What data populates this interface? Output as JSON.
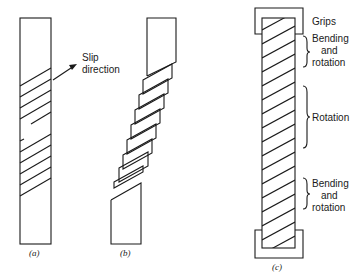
{
  "figure": {
    "panels": [
      {
        "id": "a",
        "caption": "(a)",
        "annotation": {
          "line1": "Slip",
          "line2": "direction"
        }
      },
      {
        "id": "b",
        "caption": "(b)"
      },
      {
        "id": "c",
        "caption": "(c)",
        "labels": {
          "grips": "Grips",
          "top_region": {
            "line1": "Bending",
            "line2": "and",
            "line3": "rotation"
          },
          "middle_region": "Rotation",
          "bottom_region": {
            "line1": "Bending",
            "line2": "and",
            "line3": "rotation"
          }
        }
      }
    ],
    "colors": {
      "ink": "#1a1a1a",
      "background": "#ffffff"
    }
  }
}
